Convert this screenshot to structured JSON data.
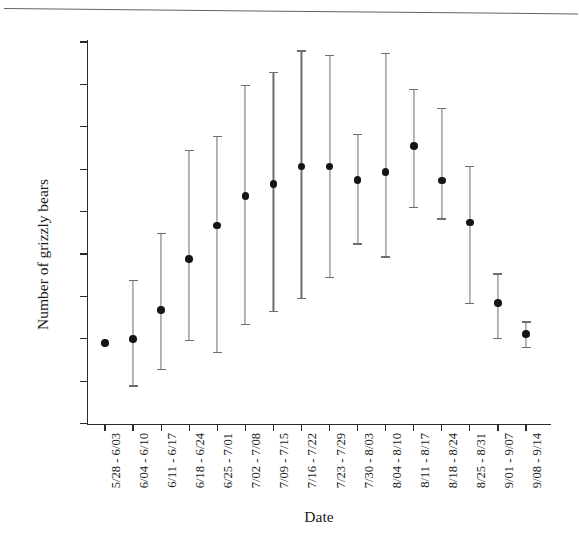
{
  "figure": {
    "y_axis_title": "Number of grizzly bears",
    "x_axis_title": "Date"
  },
  "chart_data": {
    "type": "scatter",
    "title": "",
    "subtitle": "",
    "xlabel": "Date",
    "ylabel": "Number of grizzly bears",
    "xlim_categories": 16,
    "ylim": [
      0,
      90
    ],
    "ytick_labels": [
      "0",
      "10",
      "20",
      "30",
      "40",
      "50",
      "60",
      "70",
      "80",
      "90"
    ],
    "ytick_values": [
      0,
      10,
      20,
      30,
      40,
      50,
      60,
      70,
      80,
      90
    ],
    "grid": false,
    "legend_position": "none",
    "error_bar_style": "capped-vertical",
    "marker_style": "filled-circle",
    "marker_color": "#151515",
    "error_bar_color": "#6e6e72",
    "axis_color": "#2b2b2b",
    "categories": [
      "5/28 - 6/03",
      "6/04 - 6/10",
      "6/11 - 6/17",
      "6/18 - 6/24",
      "6/25 - 7/01",
      "7/02 - 7/08",
      "7/09 - 7/15",
      "7/16 - 7/22",
      "7/23 - 7/29",
      "7/30 - 8/03",
      "8/04 - 8/10",
      "8/11 - 8/17",
      "8/18 - 8/24",
      "8/25 - 8/31",
      "9/01 - 9/07",
      "9/08 - 9/14"
    ],
    "series": [
      {
        "name": "Estimated number of grizzly bears",
        "values": [
          19.0,
          20.0,
          26.8,
          38.8,
          46.7,
          53.7,
          56.5,
          60.6,
          60.6,
          57.4,
          59.4,
          65.4,
          57.3,
          47.4,
          28.4,
          21.1
        ],
        "ci_lower": [
          19.0,
          9.0,
          12.8,
          19.8,
          16.8,
          23.5,
          26.5,
          29.6,
          34.5,
          42.5,
          39.4,
          51.1,
          48.4,
          28.4,
          20.1,
          18.1
        ],
        "ci_upper": [
          19.0,
          33.9,
          44.9,
          64.6,
          67.8,
          79.8,
          83.0,
          88.0,
          86.9,
          68.4,
          87.5,
          79.0,
          74.5,
          60.8,
          35.4,
          24.1
        ]
      }
    ]
  }
}
